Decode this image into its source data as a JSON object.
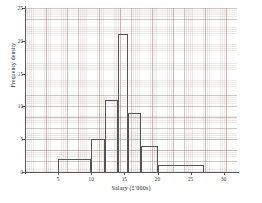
{
  "chart_data": {
    "type": "bar",
    "title": "",
    "xlabel": "Salary (£'000s)",
    "ylabel": "Frequency density",
    "xlim": [
      0,
      32
    ],
    "ylim": [
      0,
      25
    ],
    "xticks": [
      5,
      10,
      15,
      20,
      25,
      30
    ],
    "xtick_labels": [
      "5",
      "10",
      "15",
      "20",
      "25",
      "30"
    ],
    "yticks": [
      0,
      5,
      10,
      15,
      20,
      25
    ],
    "ytick_labels": [
      "0",
      "5",
      "10",
      "15",
      "20",
      "25"
    ],
    "grid": true,
    "grid_style": "graph-paper",
    "legend": "none",
    "bins": [
      {
        "label": "5-10",
        "x0": 5,
        "x1": 10,
        "value": 2
      },
      {
        "label": "10-12",
        "x0": 10,
        "x1": 12,
        "value": 5
      },
      {
        "label": "12-14",
        "x0": 12,
        "x1": 14,
        "value": 11
      },
      {
        "label": "14-15.5",
        "x0": 14,
        "x1": 15.5,
        "value": 21
      },
      {
        "label": "15.5-17.5",
        "x0": 15.5,
        "x1": 17.5,
        "value": 9
      },
      {
        "label": "17.5-20",
        "x0": 17.5,
        "x1": 20,
        "value": 4
      },
      {
        "label": "20-27",
        "x0": 20,
        "x1": 27,
        "value": 1
      }
    ],
    "bar_edge_color": "#555555",
    "bar_fill_color": "none",
    "axis_color": "#5a5a5a",
    "grid_color": "#aa9696",
    "background_color": "#ffffff"
  }
}
